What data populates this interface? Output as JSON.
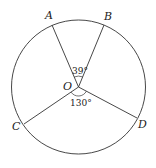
{
  "diagram": {
    "type": "circle-with-radii",
    "center": {
      "label": "O",
      "x": 78.5,
      "y": 87
    },
    "radius": 67,
    "points": [
      {
        "id": "A",
        "label": "A",
        "x": 52,
        "y": 25,
        "lx": 45,
        "ly": 19
      },
      {
        "id": "B",
        "label": "B",
        "x": 104,
        "y": 25,
        "lx": 104,
        "ly": 20
      },
      {
        "id": "C",
        "label": "C",
        "x": 24,
        "y": 124,
        "lx": 12,
        "ly": 130
      },
      {
        "id": "D",
        "label": "D",
        "x": 137,
        "y": 118,
        "lx": 138,
        "ly": 128
      }
    ],
    "angles": [
      {
        "between": [
          "A",
          "B"
        ],
        "value": "39°"
      },
      {
        "between": [
          "C",
          "D"
        ],
        "value": "130°"
      }
    ],
    "colors": {
      "stroke": "#333333",
      "text": "#222222",
      "background": "#ffffff"
    }
  }
}
